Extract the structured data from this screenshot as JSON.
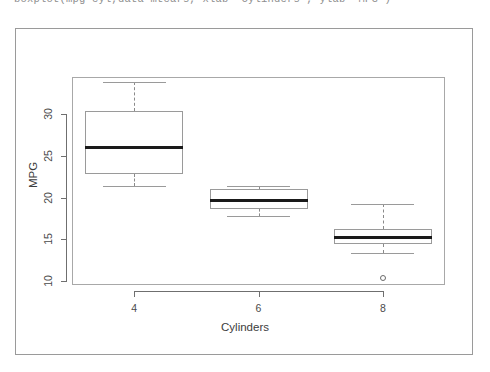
{
  "console": {
    "command": "boxplot(mpg~cyl,data=mtcars, xlab=\"Cylinders\", ylab=\"MPG\")"
  },
  "plot": {
    "y_axis_title": "MPG",
    "x_axis_title": "Cylinders",
    "frame_color": "#9a9a9a",
    "box_color": "#9a9a9a",
    "median_color": "#1a1a1a",
    "whisker_color": "#8a8a8a",
    "background": "#ffffff"
  },
  "chart_data": {
    "type": "box",
    "title": "",
    "xlabel": "Cylinders",
    "ylabel": "MPG",
    "xlim": [
      3,
      9
    ],
    "ylim": [
      9.5,
      34.5
    ],
    "ytick_labels": [
      "10",
      "15",
      "20",
      "25",
      "30"
    ],
    "ytick_values": [
      10,
      15,
      20,
      25,
      30
    ],
    "xtick_labels": [
      "4",
      "6",
      "8"
    ],
    "xtick_values": [
      4,
      6,
      8
    ],
    "grid": false,
    "legend": null,
    "categories": [
      "4",
      "6",
      "8"
    ],
    "boxes": [
      {
        "category": "4",
        "whisker_low": 21.4,
        "q1": 22.8,
        "median": 26.0,
        "q3": 30.4,
        "whisker_high": 33.9,
        "outliers": []
      },
      {
        "category": "6",
        "whisker_low": 17.8,
        "q1": 18.65,
        "median": 19.7,
        "q3": 21.0,
        "whisker_high": 21.4,
        "outliers": []
      },
      {
        "category": "8",
        "whisker_low": 13.3,
        "q1": 14.4,
        "median": 15.2,
        "q3": 16.25,
        "whisker_high": 19.2,
        "outliers": [
          10.4
        ]
      }
    ]
  }
}
